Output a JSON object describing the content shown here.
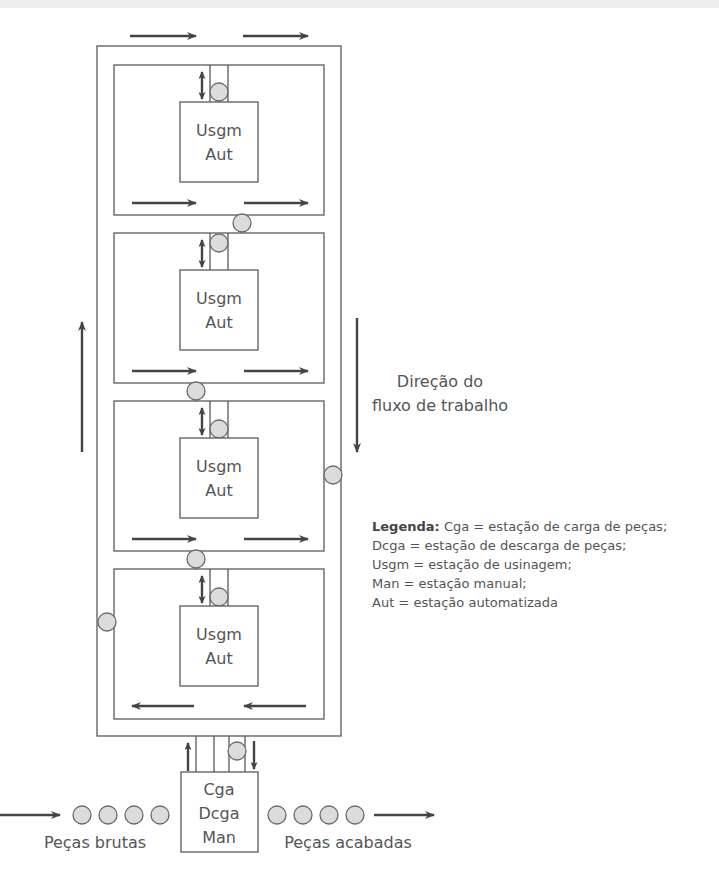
{
  "diagram": {
    "stations": [
      {
        "line1": "Usgm",
        "line2": "Aut"
      },
      {
        "line1": "Usgm",
        "line2": "Aut"
      },
      {
        "line1": "Usgm",
        "line2": "Aut"
      },
      {
        "line1": "Usgm",
        "line2": "Aut"
      }
    ],
    "load_station": {
      "line1": "Cga",
      "line2": "Dcga",
      "line3": "Man"
    },
    "flow_direction_label": {
      "line1": "Direção do",
      "line2": "fluxo de trabalho"
    },
    "raw_parts_label": "Peças brutas",
    "finished_parts_label": "Peças acabadas",
    "raw_parts_count": 4,
    "finished_parts_count": 4
  },
  "legend": {
    "title": "Legenda:",
    "items": [
      "Cga = estação de carga de peças;",
      "Dcga = estação de descarga de peças;",
      "Usgm = estação de usinagem;",
      "Man = estação manual;",
      "Aut = estação automatizada"
    ]
  },
  "colors": {
    "line": "#5a5a5a",
    "arrow": "#444444",
    "part_fill": "#dcdcdc",
    "text": "#555555"
  }
}
